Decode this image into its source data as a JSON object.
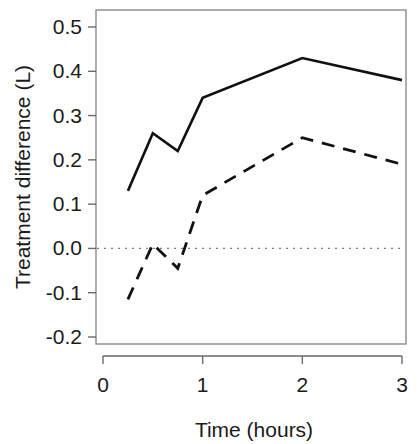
{
  "chart_data": {
    "type": "line",
    "title": "",
    "subtitle": "",
    "xlabel": "Time (hours)",
    "ylabel": "Treatment difference (L)",
    "xlim": [
      -0.07,
      3.05
    ],
    "ylim": [
      -0.22,
      0.53
    ],
    "xticks": [
      0,
      1,
      2,
      3
    ],
    "xtick_labels": [
      "0",
      "1",
      "2",
      "3"
    ],
    "yticks": [
      0.5,
      0.4,
      0.3,
      0.2,
      0.1,
      0.0,
      -0.1,
      -0.2
    ],
    "ytick_labels": [
      "0.5",
      "0.4",
      "0.3",
      "0.2",
      "0.1",
      "0.0",
      "-0.1",
      "-0.2"
    ],
    "grid": false,
    "legend": "none",
    "annotations": [
      {
        "name": "zero-reference-line",
        "kind": "horizontal-dotted-line",
        "y": 0.0
      }
    ],
    "x": [
      0.25,
      0.5,
      0.75,
      1.0,
      2.0,
      3.0
    ],
    "series": [
      {
        "name": "solid-series",
        "style": "solid",
        "color": "#111111",
        "values": [
          0.13,
          0.26,
          0.22,
          0.34,
          0.43,
          0.38
        ]
      },
      {
        "name": "dashed-series",
        "style": "dashed",
        "color": "#111111",
        "values": [
          -0.115,
          0.01,
          -0.045,
          0.12,
          0.25,
          0.19
        ]
      }
    ]
  },
  "axes": {
    "y_title": "Treatment difference (L)",
    "x_title": "Time (hours)"
  }
}
